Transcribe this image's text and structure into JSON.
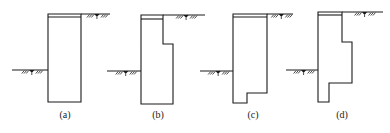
{
  "figure": {
    "panels": [
      {
        "id": "a",
        "label": "(a)",
        "label_x": 65,
        "outline": [
          [
            48,
            14
          ],
          [
            81,
            14
          ],
          [
            81,
            102
          ],
          [
            48,
            102
          ]
        ],
        "cap_y": 17,
        "retained_ground": {
          "y": 14,
          "x1": 81,
          "x2": 110
        },
        "excavation_ground": {
          "y": 70,
          "x1": 12,
          "x2": 48
        }
      },
      {
        "id": "b",
        "label": "(b)",
        "label_x": 158,
        "outline": [
          [
            141,
            15
          ],
          [
            163,
            15
          ],
          [
            163,
            44
          ],
          [
            173,
            44
          ],
          [
            173,
            104
          ],
          [
            141,
            104
          ]
        ],
        "cap_y": 19,
        "retained_ground": {
          "y": 15,
          "x1": 163,
          "x2": 205
        },
        "excavation_ground": {
          "y": 71,
          "x1": 107,
          "x2": 141
        }
      },
      {
        "id": "c",
        "label": "(c)",
        "label_x": 253,
        "outline": [
          [
            233,
            14
          ],
          [
            267,
            14
          ],
          [
            267,
            93
          ],
          [
            247,
            93
          ],
          [
            247,
            103
          ],
          [
            233,
            103
          ]
        ],
        "cap_y": 17,
        "retained_ground": {
          "y": 14,
          "x1": 267,
          "x2": 293
        },
        "excavation_ground": {
          "y": 71,
          "x1": 200,
          "x2": 233
        }
      },
      {
        "id": "d",
        "label": "(d)",
        "label_x": 342,
        "outline": [
          [
            318,
            12
          ],
          [
            342,
            12
          ],
          [
            342,
            42
          ],
          [
            352,
            42
          ],
          [
            352,
            83
          ],
          [
            329,
            83
          ],
          [
            329,
            102
          ],
          [
            318,
            102
          ]
        ],
        "cap_y": 15,
        "retained_ground": {
          "y": 12,
          "x1": 342,
          "x2": 383
        },
        "excavation_ground": {
          "y": 70,
          "x1": 286,
          "x2": 318
        }
      }
    ],
    "label_y": 118,
    "line_color": "#1a1a1a",
    "background": "#ffffff"
  }
}
